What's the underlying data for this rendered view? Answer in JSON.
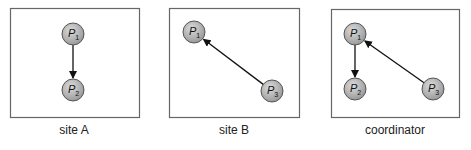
{
  "panels": [
    {
      "caption": "site A",
      "box": {
        "x": 10,
        "y": 8,
        "w": 129,
        "h": 109
      },
      "nodes": [
        {
          "id": "P1",
          "label": "P",
          "sub": "1",
          "cx": 73,
          "cy": 34
        },
        {
          "id": "P2",
          "label": "P",
          "sub": "2",
          "cx": 73,
          "cy": 90
        }
      ],
      "edges": [
        {
          "from": "P1",
          "to": "P2"
        }
      ]
    },
    {
      "caption": "site B",
      "box": {
        "x": 169,
        "y": 8,
        "w": 130,
        "h": 109
      },
      "nodes": [
        {
          "id": "P1",
          "label": "P",
          "sub": "1",
          "cx": 194,
          "cy": 32
        },
        {
          "id": "P3",
          "label": "P",
          "sub": "3",
          "cx": 272,
          "cy": 91
        }
      ],
      "edges": [
        {
          "from": "P3",
          "to": "P1"
        }
      ]
    },
    {
      "caption": "coordinator",
      "box": {
        "x": 331,
        "y": 9,
        "w": 128,
        "h": 108
      },
      "nodes": [
        {
          "id": "P1",
          "label": "P",
          "sub": "1",
          "cx": 355,
          "cy": 34
        },
        {
          "id": "P2",
          "label": "P",
          "sub": "2",
          "cx": 355,
          "cy": 89
        },
        {
          "id": "P3",
          "label": "P",
          "sub": "3",
          "cx": 433,
          "cy": 89
        }
      ],
      "edges": [
        {
          "from": "P1",
          "to": "P2"
        },
        {
          "from": "P3",
          "to": "P1"
        }
      ]
    }
  ],
  "colors": {
    "node_fill": "#b8b8b8",
    "node_stroke": "#555555",
    "edge": "#111111",
    "box": "#666666"
  }
}
